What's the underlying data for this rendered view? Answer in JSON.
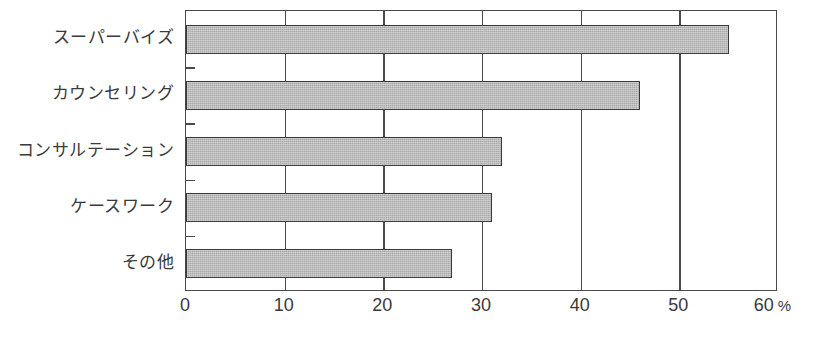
{
  "chart_data": {
    "type": "bar",
    "orientation": "horizontal",
    "title": "",
    "subtitle": "",
    "xlabel": "",
    "ylabel": "",
    "unit": "%",
    "categories": [
      "スーパーバイズ",
      "カウンセリング",
      "コンサルテーション",
      "ケースワーク",
      "その他"
    ],
    "values": [
      55,
      46,
      32,
      31,
      27
    ],
    "xlim": [
      0,
      60
    ],
    "xticks": [
      0,
      10,
      20,
      30,
      40,
      50,
      60
    ],
    "xticklabels": [
      "0",
      "10",
      "20",
      "30",
      "40",
      "50",
      "60"
    ],
    "grid": true,
    "grid_axis": "x",
    "legend": false,
    "bar_fill_color": "#a9a9a9",
    "bar_border_color": "#3b3b3b",
    "axis_color": "#4a4a4a",
    "background_color": "#ffffff"
  },
  "axis": {
    "unit_suffix": "%"
  }
}
